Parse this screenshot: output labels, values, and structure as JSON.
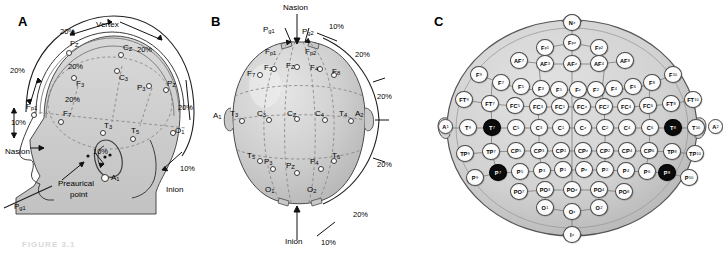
{
  "figure": {
    "caption": "FIGURE 3.1",
    "panels": [
      {
        "id": "A",
        "label": "A"
      },
      {
        "id": "B",
        "label": "B"
      },
      {
        "id": "C",
        "label": "C"
      }
    ]
  },
  "panelA": {
    "label": "A",
    "landmarks": [
      "Nasion",
      "Inion",
      "Vertex",
      "Preaurical point"
    ],
    "annotations": [
      {
        "text": "Vertex",
        "x": 96,
        "y": 23
      },
      {
        "text": "Nasion",
        "x": 5,
        "y": 148
      },
      {
        "text": "Inion",
        "x": 168,
        "y": 186
      },
      {
        "text": "Preaurical",
        "x": 62,
        "y": 182
      },
      {
        "text": "point",
        "x": 74,
        "y": 192
      }
    ],
    "percents": [
      {
        "text": "20%",
        "x": 60,
        "y": 27
      },
      {
        "text": "20%",
        "x": 137,
        "y": 45
      },
      {
        "text": "20%",
        "x": 10,
        "y": 66
      },
      {
        "text": "20%",
        "x": 68,
        "y": 62
      },
      {
        "text": "20%",
        "x": 65,
        "y": 95
      },
      {
        "text": "20%",
        "x": 178,
        "y": 103
      },
      {
        "text": "10%",
        "x": 11,
        "y": 118
      },
      {
        "text": "10%",
        "x": 93,
        "y": 147
      },
      {
        "text": "10%",
        "x": 180,
        "y": 164
      }
    ],
    "electrodes": [
      {
        "label": "Fz",
        "base": "F",
        "sub": "Z",
        "x": 68,
        "y": 42
      },
      {
        "label": "Cz",
        "base": "C",
        "sub": "Z",
        "x": 120,
        "y": 45
      },
      {
        "label": "Pz",
        "base": "P",
        "sub": "Z",
        "x": 166,
        "y": 80
      },
      {
        "label": "Fp1",
        "base": "F",
        "sub": "p1",
        "x": 30,
        "y": 105
      },
      {
        "label": "F3",
        "base": "F",
        "sub": "3",
        "x": 74,
        "y": 80
      },
      {
        "label": "C3",
        "base": "C",
        "sub": "3",
        "x": 118,
        "y": 73
      },
      {
        "label": "P3",
        "base": "P",
        "sub": "3",
        "x": 148,
        "y": 88
      },
      {
        "label": "F7",
        "base": "F",
        "sub": "7",
        "x": 62,
        "y": 112
      },
      {
        "label": "T3",
        "base": "T",
        "sub": "3",
        "x": 103,
        "y": 126
      },
      {
        "label": "T5",
        "base": "T",
        "sub": "5",
        "x": 133,
        "y": 130
      },
      {
        "label": "O1",
        "base": "O",
        "sub": "1",
        "x": 172,
        "y": 127
      },
      {
        "label": "A1",
        "base": "A",
        "sub": "1",
        "x": 104,
        "y": 172
      },
      {
        "label": "Pg1",
        "base": "P",
        "sub": "g1",
        "x": 20,
        "y": 202
      }
    ]
  },
  "panelB": {
    "label": "B",
    "annotations": [
      {
        "text": "Nasion",
        "x": 82,
        "y": 8
      },
      {
        "text": "Inion",
        "x": 85,
        "y": 236
      }
    ],
    "percents": [
      {
        "text": "10%",
        "x": 124,
        "y": 22
      },
      {
        "text": "20%",
        "x": 148,
        "y": 50
      },
      {
        "text": "20%",
        "x": 168,
        "y": 92
      },
      {
        "text": "20%",
        "x": 168,
        "y": 160
      },
      {
        "text": "20%",
        "x": 150,
        "y": 212
      },
      {
        "text": "10%",
        "x": 117,
        "y": 236
      }
    ],
    "electrodes": [
      {
        "label": "Pg1",
        "base": "P",
        "sub": "g1",
        "x": 62,
        "y": 30
      },
      {
        "label": "Pg2",
        "base": "P",
        "sub": "g2",
        "x": 100,
        "y": 32
      },
      {
        "label": "Fp1",
        "base": "F",
        "sub": "p1",
        "x": 62,
        "y": 48
      },
      {
        "label": "Fp2",
        "base": "F",
        "sub": "p2",
        "x": 105,
        "y": 48
      },
      {
        "label": "F7",
        "base": "F",
        "sub": "7",
        "x": 28,
        "y": 74
      },
      {
        "label": "F3",
        "base": "F",
        "sub": "3",
        "x": 52,
        "y": 70
      },
      {
        "label": "Fz",
        "base": "F",
        "sub": "Z",
        "x": 82,
        "y": 70
      },
      {
        "label": "F4",
        "base": "F",
        "sub": "4",
        "x": 110,
        "y": 70
      },
      {
        "label": "F8",
        "base": "F",
        "sub": "8",
        "x": 133,
        "y": 74
      },
      {
        "label": "A1",
        "base": "A",
        "sub": "1",
        "x": 10,
        "y": 114
      },
      {
        "label": "T3",
        "base": "T",
        "sub": "3",
        "x": 29,
        "y": 113
      },
      {
        "label": "C3",
        "base": "C",
        "sub": "3",
        "x": 56,
        "y": 114
      },
      {
        "label": "Cz",
        "base": "C",
        "sub": "Z",
        "x": 86,
        "y": 114
      },
      {
        "label": "C4",
        "base": "C",
        "sub": "4",
        "x": 114,
        "y": 114
      },
      {
        "label": "T4",
        "base": "T",
        "sub": "4",
        "x": 138,
        "y": 113
      },
      {
        "label": "A2",
        "base": "A",
        "sub": "2",
        "x": 152,
        "y": 113
      },
      {
        "label": "T5",
        "base": "T",
        "sub": "5",
        "x": 28,
        "y": 158
      },
      {
        "label": "P3",
        "base": "P",
        "sub": "3",
        "x": 52,
        "y": 163
      },
      {
        "label": "Pz",
        "base": "P",
        "sub": "Z",
        "x": 82,
        "y": 167
      },
      {
        "label": "P4",
        "base": "P",
        "sub": "4",
        "x": 110,
        "y": 163
      },
      {
        "label": "T6",
        "base": "T",
        "sub": "6",
        "x": 134,
        "y": 158
      },
      {
        "label": "O1",
        "base": "O",
        "sub": "1",
        "x": 62,
        "y": 190
      },
      {
        "label": "O2",
        "base": "O",
        "sub": "2",
        "x": 104,
        "y": 190
      }
    ]
  },
  "panelC": {
    "label": "C",
    "system": "10-10",
    "highlight_color": "#0b0b0b",
    "rows": [
      {
        "name": "nz",
        "nodes": [
          {
            "base": "N",
            "sub": "z",
            "x": 133,
            "y": 14,
            "dark": false
          }
        ]
      },
      {
        "name": "fp",
        "nodes": [
          {
            "base": "F",
            "sub": "p1",
            "x": 106,
            "y": 39,
            "dark": false
          },
          {
            "base": "F",
            "sub": "pz",
            "x": 133,
            "y": 34,
            "dark": false
          },
          {
            "base": "F",
            "sub": "p2",
            "x": 160,
            "y": 39,
            "dark": false
          }
        ]
      },
      {
        "name": "af",
        "nodes": [
          {
            "base": "AF",
            "sub": "7",
            "x": 80,
            "y": 52,
            "dark": false
          },
          {
            "base": "AF",
            "sub": "3",
            "x": 106,
            "y": 55,
            "dark": false
          },
          {
            "base": "AF",
            "sub": "z",
            "x": 133,
            "y": 55,
            "dark": false
          },
          {
            "base": "AF",
            "sub": "4",
            "x": 160,
            "y": 55,
            "dark": false
          },
          {
            "base": "AF",
            "sub": "8",
            "x": 186,
            "y": 52,
            "dark": false
          }
        ]
      },
      {
        "name": "f",
        "nodes": [
          {
            "base": "F",
            "sub": "9",
            "x": 40,
            "y": 66,
            "dark": false
          },
          {
            "base": "F",
            "sub": "7",
            "x": 62,
            "y": 74,
            "dark": false
          },
          {
            "base": "F",
            "sub": "5",
            "x": 82,
            "y": 78,
            "dark": false
          },
          {
            "base": "F",
            "sub": "3",
            "x": 102,
            "y": 80,
            "dark": false
          },
          {
            "base": "F",
            "sub": "1",
            "x": 120,
            "y": 81,
            "dark": false
          },
          {
            "base": "F",
            "sub": "z",
            "x": 139,
            "y": 81,
            "dark": false
          },
          {
            "base": "F",
            "sub": "2",
            "x": 157,
            "y": 81,
            "dark": false
          },
          {
            "base": "F",
            "sub": "4",
            "x": 175,
            "y": 80,
            "dark": false
          },
          {
            "base": "F",
            "sub": "6",
            "x": 194,
            "y": 78,
            "dark": false
          },
          {
            "base": "F",
            "sub": "8",
            "x": 213,
            "y": 74,
            "dark": false
          },
          {
            "base": "F",
            "sub": "10",
            "x": 234,
            "y": 66,
            "dark": false
          }
        ]
      },
      {
        "name": "ft",
        "nodes": [
          {
            "base": "FT",
            "sub": "9",
            "x": 25,
            "y": 91,
            "dark": false
          },
          {
            "base": "FT",
            "sub": "7",
            "x": 51,
            "y": 95,
            "dark": false
          },
          {
            "base": "FC",
            "sub": "5",
            "x": 76,
            "y": 97,
            "dark": false
          },
          {
            "base": "FC",
            "sub": "3",
            "x": 99,
            "y": 98,
            "dark": false
          },
          {
            "base": "FC",
            "sub": "1",
            "x": 121,
            "y": 98,
            "dark": false
          },
          {
            "base": "FC",
            "sub": "z",
            "x": 143,
            "y": 98,
            "dark": false
          },
          {
            "base": "FC",
            "sub": "2",
            "x": 165,
            "y": 98,
            "dark": false
          },
          {
            "base": "FC",
            "sub": "4",
            "x": 187,
            "y": 98,
            "dark": false
          },
          {
            "base": "FC",
            "sub": "6",
            "x": 209,
            "y": 97,
            "dark": false
          },
          {
            "base": "FT",
            "sub": "8",
            "x": 232,
            "y": 95,
            "dark": false
          },
          {
            "base": "FT",
            "sub": "10",
            "x": 254,
            "y": 91,
            "dark": false
          }
        ]
      },
      {
        "name": "c",
        "nodes": [
          {
            "base": "A",
            "sub": "1",
            "x": 8,
            "y": 119,
            "dark": false
          },
          {
            "base": "T",
            "sub": "9",
            "x": 29,
            "y": 119,
            "dark": false
          },
          {
            "base": "T",
            "sub": "7",
            "x": 53,
            "y": 119,
            "dark": true
          },
          {
            "base": "C",
            "sub": "5",
            "x": 77,
            "y": 119,
            "dark": false
          },
          {
            "base": "C",
            "sub": "3",
            "x": 100,
            "y": 119,
            "dark": false
          },
          {
            "base": "C",
            "sub": "1",
            "x": 122,
            "y": 119,
            "dark": false
          },
          {
            "base": "C",
            "sub": "z",
            "x": 144,
            "y": 119,
            "dark": false
          },
          {
            "base": "C",
            "sub": "2",
            "x": 166,
            "y": 119,
            "dark": false
          },
          {
            "base": "C",
            "sub": "4",
            "x": 188,
            "y": 119,
            "dark": false
          },
          {
            "base": "C",
            "sub": "6",
            "x": 211,
            "y": 119,
            "dark": false
          },
          {
            "base": "T",
            "sub": "8",
            "x": 234,
            "y": 119,
            "dark": true
          },
          {
            "base": "T",
            "sub": "10",
            "x": 257,
            "y": 119,
            "dark": false
          },
          {
            "base": "A",
            "sub": "2",
            "x": 278,
            "y": 119,
            "dark": false
          }
        ]
      },
      {
        "name": "tp",
        "nodes": [
          {
            "base": "TP",
            "sub": "9",
            "x": 26,
            "y": 145,
            "dark": false
          },
          {
            "base": "TP",
            "sub": "7",
            "x": 52,
            "y": 143,
            "dark": false
          },
          {
            "base": "CP",
            "sub": "5",
            "x": 77,
            "y": 142,
            "dark": false
          },
          {
            "base": "CP",
            "sub": "3",
            "x": 100,
            "y": 142,
            "dark": false
          },
          {
            "base": "CP",
            "sub": "1",
            "x": 122,
            "y": 142,
            "dark": false
          },
          {
            "base": "CP",
            "sub": "z",
            "x": 144,
            "y": 142,
            "dark": false
          },
          {
            "base": "CP",
            "sub": "2",
            "x": 166,
            "y": 142,
            "dark": false
          },
          {
            "base": "CP",
            "sub": "4",
            "x": 188,
            "y": 142,
            "dark": false
          },
          {
            "base": "CP",
            "sub": "6",
            "x": 210,
            "y": 142,
            "dark": false
          },
          {
            "base": "TP",
            "sub": "8",
            "x": 233,
            "y": 143,
            "dark": false
          },
          {
            "base": "TP",
            "sub": "10",
            "x": 256,
            "y": 145,
            "dark": false
          }
        ]
      },
      {
        "name": "p",
        "nodes": [
          {
            "base": "P",
            "sub": "9",
            "x": 36,
            "y": 169,
            "dark": false
          },
          {
            "base": "P",
            "sub": "7",
            "x": 59,
            "y": 164,
            "dark": true
          },
          {
            "base": "P",
            "sub": "5",
            "x": 81,
            "y": 163,
            "dark": false
          },
          {
            "base": "P",
            "sub": "3",
            "x": 103,
            "y": 162,
            "dark": false
          },
          {
            "base": "P",
            "sub": "1",
            "x": 124,
            "y": 161,
            "dark": false
          },
          {
            "base": "P",
            "sub": "z",
            "x": 145,
            "y": 161,
            "dark": false
          },
          {
            "base": "P",
            "sub": "2",
            "x": 166,
            "y": 161,
            "dark": false
          },
          {
            "base": "P",
            "sub": "4",
            "x": 187,
            "y": 162,
            "dark": false
          },
          {
            "base": "P",
            "sub": "6",
            "x": 208,
            "y": 163,
            "dark": false
          },
          {
            "base": "P",
            "sub": "8",
            "x": 228,
            "y": 164,
            "dark": true
          },
          {
            "base": "P",
            "sub": "10",
            "x": 250,
            "y": 169,
            "dark": false
          }
        ]
      },
      {
        "name": "po",
        "nodes": [
          {
            "base": "PO",
            "sub": "7",
            "x": 80,
            "y": 183,
            "dark": false
          },
          {
            "base": "PO",
            "sub": "3",
            "x": 106,
            "y": 181,
            "dark": false
          },
          {
            "base": "PO",
            "sub": "z",
            "x": 133,
            "y": 181,
            "dark": false
          },
          {
            "base": "PO",
            "sub": "4",
            "x": 160,
            "y": 181,
            "dark": false
          },
          {
            "base": "PO",
            "sub": "8",
            "x": 185,
            "y": 183,
            "dark": false
          }
        ]
      },
      {
        "name": "o",
        "nodes": [
          {
            "base": "O",
            "sub": "1",
            "x": 106,
            "y": 199,
            "dark": false
          },
          {
            "base": "O",
            "sub": "z",
            "x": 133,
            "y": 203,
            "dark": false
          },
          {
            "base": "O",
            "sub": "2",
            "x": 160,
            "y": 199,
            "dark": false
          }
        ]
      },
      {
        "name": "iz",
        "nodes": [
          {
            "base": "I",
            "sub": "z",
            "x": 133,
            "y": 226,
            "dark": false
          }
        ]
      }
    ]
  }
}
